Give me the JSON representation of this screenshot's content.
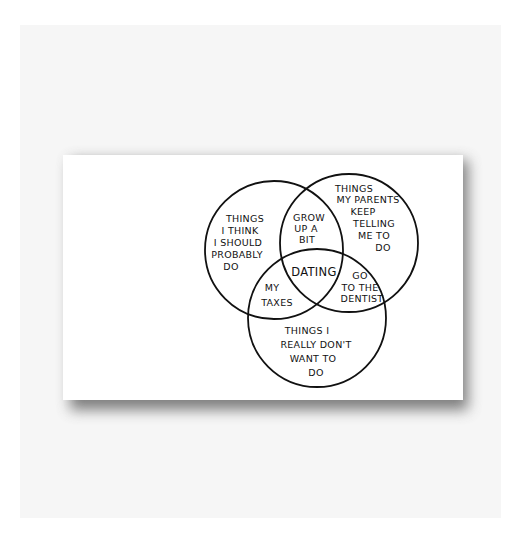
{
  "diagram": {
    "type": "venn",
    "sets": [
      {
        "id": "left",
        "lines": [
          "THINGS",
          "I THINK",
          "I SHOULD",
          "PROBABLY",
          "DO"
        ]
      },
      {
        "id": "right",
        "lines": [
          "THINGS",
          "MY PARENTS",
          "KEEP",
          "TELLING",
          "ME TO",
          "DO"
        ]
      },
      {
        "id": "bottom",
        "lines": [
          "THINGS I",
          "REALLY DON'T",
          "WANT TO",
          "DO"
        ]
      }
    ],
    "intersections": {
      "left_right": [
        "GROW",
        "UP A",
        "BIT"
      ],
      "left_bottom": [
        "MY",
        "TAXES"
      ],
      "right_bottom": [
        "GO",
        "TO THE",
        "DENTIST"
      ],
      "all": [
        "DATING"
      ]
    },
    "colors": {
      "ink": "#111111",
      "canvas": "#ffffff",
      "backdrop": "#f6f6f6",
      "shadow": "#6a6a6a"
    }
  }
}
